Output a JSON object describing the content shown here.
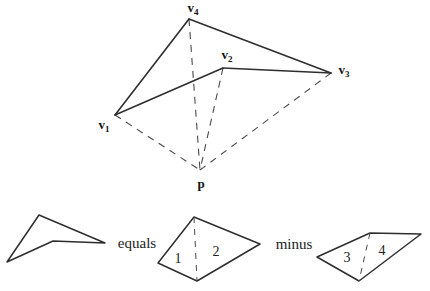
{
  "canvas": {
    "width": 430,
    "height": 291,
    "background": "#ffffff"
  },
  "colors": {
    "solid_line": "#2e2e2e",
    "dashed_line": "#4a4a4a",
    "text": "#111111"
  },
  "tetrahedron": {
    "vertices": {
      "v1": {
        "x": 115,
        "y": 115,
        "label": "v",
        "sub": "1",
        "label_x": 104,
        "label_y": 129
      },
      "v2": {
        "x": 223,
        "y": 68,
        "label": "v",
        "sub": "2",
        "label_x": 227,
        "label_y": 59
      },
      "v3": {
        "x": 331,
        "y": 73,
        "label": "v",
        "sub": "3",
        "label_x": 344,
        "label_y": 74
      },
      "v4": {
        "x": 189,
        "y": 19,
        "label": "v",
        "sub": "4",
        "label_x": 193,
        "label_y": 12
      }
    },
    "apex": {
      "x": 200,
      "y": 170,
      "label": "p",
      "label_x": 201,
      "label_y": 188
    },
    "solid_edges": [
      [
        "v1",
        "v4"
      ],
      [
        "v4",
        "v3"
      ],
      [
        "v1",
        "v2"
      ],
      [
        "v2",
        "v3"
      ]
    ],
    "dashed_edges": [
      [
        "v4",
        "p"
      ],
      [
        "v2",
        "p"
      ],
      [
        "v1",
        "p"
      ],
      [
        "v3",
        "p"
      ]
    ]
  },
  "decomposition": {
    "shapes": [
      {
        "name": "result-shape",
        "points": [
          [
            39,
            215
          ],
          [
            105,
            243
          ],
          [
            53,
            241
          ],
          [
            7,
            262
          ]
        ]
      },
      {
        "name": "minuend-shape",
        "points": [
          [
            194,
            217
          ],
          [
            260,
            244
          ],
          [
            197,
            281
          ],
          [
            158,
            263
          ]
        ],
        "divider": [
          [
            194,
            217
          ],
          [
            197,
            281
          ]
        ],
        "regions": [
          {
            "text": "1",
            "x": 178,
            "y": 263
          },
          {
            "text": "2",
            "x": 216,
            "y": 256
          }
        ]
      },
      {
        "name": "subtrahend-shape",
        "points": [
          [
            317,
            257
          ],
          [
            370,
            233
          ],
          [
            421,
            234
          ],
          [
            359,
            281
          ]
        ],
        "divider": [
          [
            370,
            233
          ],
          [
            359,
            281
          ]
        ],
        "regions": [
          {
            "text": "3",
            "x": 347,
            "y": 262
          },
          {
            "text": "4",
            "x": 382,
            "y": 255
          }
        ]
      }
    ],
    "operators": [
      {
        "text": "equals",
        "x": 137,
        "y": 248
      },
      {
        "text": "minus",
        "x": 294,
        "y": 249
      }
    ]
  }
}
